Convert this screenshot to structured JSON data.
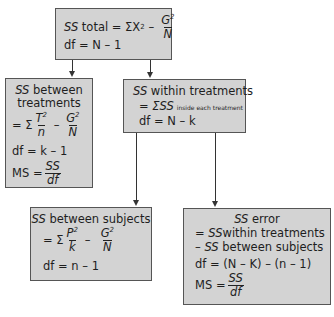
{
  "diagram": {
    "type": "flowchart",
    "colors": {
      "box_fill": "#d3d3d3",
      "box_border": "#555555",
      "arrow": "#333333"
    },
    "nodes": {
      "total": {
        "ss_label": "SS",
        "ss_name": "total",
        "formula_prefix": "= ΣX",
        "formula_exp": "2",
        "minus": "–",
        "frac_num": "G",
        "frac_num_exp": "2",
        "frac_den": "N",
        "df": "df = N – 1"
      },
      "between_treatments": {
        "ss_label": "SS",
        "ss_name": "between",
        "ss_name2": "treatments",
        "sigma": "= Σ",
        "frac1_num": "T",
        "frac1_num_exp": "2",
        "frac1_den": "n",
        "minus": "–",
        "frac2_num": "G",
        "frac2_num_exp": "2",
        "frac2_den": "N",
        "df": "df = k – 1",
        "ms_label": "MS =",
        "ms_num": "SS",
        "ms_den": "df"
      },
      "within_treatments": {
        "ss_label": "SS",
        "ss_name": "within treatments",
        "formula": "= ΣSS",
        "formula_sub": "inside each treatment",
        "df": "df = N – k"
      },
      "between_subjects": {
        "ss_label": "SS",
        "ss_name": "between subjects",
        "sigma": "= Σ",
        "frac1_num": "P",
        "frac1_num_exp": "2",
        "frac1_den": "k",
        "minus": "–",
        "frac2_num": "G",
        "frac2_num_exp": "2",
        "frac2_den": "N",
        "df": "df = n – 1"
      },
      "error": {
        "ss_label": "SS",
        "ss_name": "error",
        "line1_prefix": "=",
        "line1_ss": "SS",
        "line1_text": "within treatments",
        "line2_prefix": "–",
        "line2_ss": "SS",
        "line2_text": "between subjects",
        "df": "df = (N – K) – (n – 1)",
        "ms_label": "MS =",
        "ms_num": "SS",
        "ms_den": "df"
      }
    },
    "edges": [
      {
        "from": "total",
        "to": "between_treatments"
      },
      {
        "from": "total",
        "to": "within_treatments"
      },
      {
        "from": "within_treatments",
        "to": "between_subjects"
      },
      {
        "from": "within_treatments",
        "to": "error"
      }
    ]
  }
}
